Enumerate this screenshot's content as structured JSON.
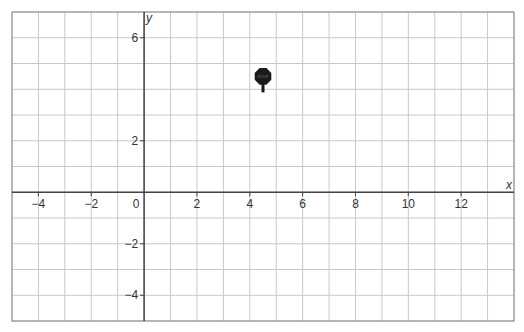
{
  "chart_data": {
    "type": "scatter",
    "title": "",
    "xlabel": "x",
    "ylabel": "y",
    "xlim": [
      -5,
      14
    ],
    "ylim": [
      -5,
      7
    ],
    "grid": true,
    "x_ticks": [
      -4,
      -2,
      0,
      2,
      4,
      6,
      8,
      10,
      12
    ],
    "y_ticks": [
      -4,
      -2,
      2,
      6
    ],
    "points": [
      {
        "label": "STOP",
        "marker": "stop-sign",
        "x": 4.5,
        "y": 4.5
      }
    ]
  },
  "colors": {
    "grid": "#c8c8c8",
    "axis": "#444444",
    "frame": "#888888",
    "marker": "#1a1a1a"
  },
  "marker_text": "STOP"
}
